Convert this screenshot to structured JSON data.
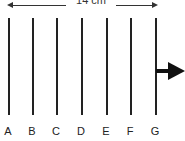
{
  "diagram": {
    "dimension": {
      "label": "14 cm"
    },
    "lines": [
      {
        "label": "A",
        "x": 8
      },
      {
        "label": "B",
        "x": 32
      },
      {
        "label": "C",
        "x": 56
      },
      {
        "label": "D",
        "x": 81
      },
      {
        "label": "E",
        "x": 106
      },
      {
        "label": "F",
        "x": 130
      },
      {
        "label": "G",
        "x": 155
      }
    ],
    "direction_arrow": "right-arrow"
  }
}
